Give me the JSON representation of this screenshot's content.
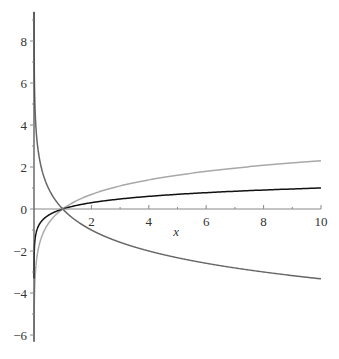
{
  "chart_data": {
    "type": "line",
    "title": "",
    "xlabel": "x",
    "ylabel": "",
    "xlim": [
      0,
      10
    ],
    "ylim": [
      -6.4,
      9.4
    ],
    "x_ticks": [
      2,
      4,
      6,
      8,
      10
    ],
    "x_tick_labels": [
      "2",
      "4",
      "6",
      "8",
      "10"
    ],
    "y_ticks": [
      -6,
      -4,
      -2,
      0,
      2,
      4,
      6,
      8
    ],
    "y_tick_labels": [
      "-6",
      "-4",
      "-2",
      "0",
      "2",
      "4",
      "6",
      "8"
    ],
    "grid": false,
    "legend": null,
    "series": [
      {
        "name": "ln(x)",
        "color": "#a8a8a8",
        "x": [
          0.05,
          0.1,
          0.2,
          0.5,
          1,
          2,
          4,
          6,
          8,
          10
        ],
        "values": [
          -3.0,
          -2.3,
          -1.61,
          -0.69,
          0,
          0.69,
          1.39,
          1.79,
          2.08,
          2.3
        ]
      },
      {
        "name": "log10(x)",
        "color": "#111111",
        "x": [
          0.001,
          0.01,
          0.1,
          0.5,
          1,
          2,
          4,
          6,
          8,
          10
        ],
        "values": [
          -3.0,
          -2.0,
          -1.0,
          -0.3,
          0,
          0.3,
          0.6,
          0.78,
          0.9,
          1.0
        ]
      },
      {
        "name": "log_{1/2}(x)",
        "color": "#666666",
        "x": [
          0.01,
          0.05,
          0.1,
          0.5,
          1,
          2,
          4,
          6,
          8,
          10
        ],
        "values": [
          6.64,
          4.32,
          3.32,
          1.0,
          0,
          -1.0,
          -2.0,
          -2.58,
          -3.0,
          -3.32
        ]
      }
    ]
  },
  "layout": {
    "x0_px": 34,
    "y0_px": 209,
    "px_per_x": 28.7,
    "px_per_y": 21,
    "axis_top_px": 12,
    "axis_bottom_px": 342,
    "axis_right_px": 321
  }
}
